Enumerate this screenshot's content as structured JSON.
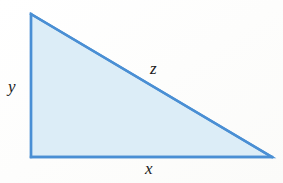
{
  "figure": {
    "kind": "right-triangle-diagram",
    "caption": "",
    "background_color": "#fdfdfc",
    "fill_color": "#dcedf7",
    "stroke_color": "#4a8fd4",
    "stroke_width": 2.4,
    "label_color": "#1b1b1b",
    "canvas": {
      "width": 283,
      "height": 183
    },
    "vertices": [
      {
        "name": "top-left-apex",
        "x": 31,
        "y": 14
      },
      {
        "name": "bottom-left-right-angle",
        "x": 31,
        "y": 157
      },
      {
        "name": "bottom-right",
        "x": 272,
        "y": 157
      }
    ],
    "edges": [
      {
        "name": "vertical-leg",
        "label": "y",
        "from": "top-left-apex",
        "to": "bottom-left-right-angle"
      },
      {
        "name": "horizontal-leg",
        "label": "x",
        "from": "bottom-left-right-angle",
        "to": "bottom-right"
      },
      {
        "name": "hypotenuse",
        "label": "z",
        "from": "top-left-apex",
        "to": "bottom-right"
      }
    ],
    "labels": {
      "vertical_leg": "y",
      "horizontal_leg": "x",
      "hypotenuse": "z"
    }
  }
}
